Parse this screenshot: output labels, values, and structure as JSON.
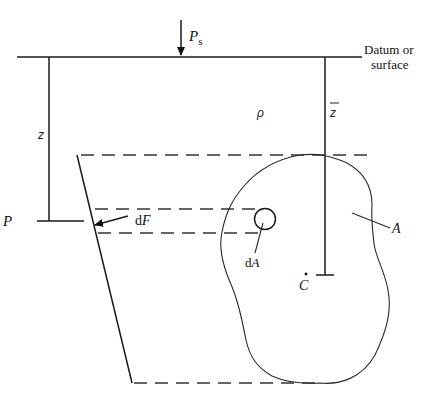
{
  "figure": {
    "type": "hydrostatic force on submerged plane surface",
    "labels": {
      "surface_pressure": "P",
      "surface_pressure_sub": "s",
      "datum": "Datum or",
      "datum_line2": "surface",
      "depth": "z",
      "density": "ρ",
      "centroid_depth": "z",
      "point": "P",
      "force_element": "dF",
      "force_d": "d",
      "force_F": "F",
      "area_element_d": "d",
      "area_element_A": "A",
      "area": "A",
      "centroid": "C"
    }
  }
}
